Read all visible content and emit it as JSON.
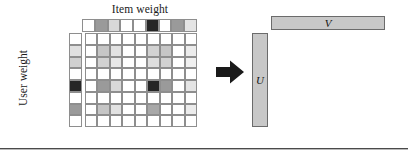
{
  "figure": {
    "labels": {
      "item_weight": "Item weight",
      "user_weight": "User weight",
      "u_vector": "U",
      "v_vector": "V"
    },
    "colors": {
      "cell_border": "#8e8e8e",
      "bar_fill": "#c8c8c8",
      "bar_border": "#6b6b6b",
      "arrow_fill": "#1a1a1a",
      "rule": "#4a4a4a",
      "white": "#ffffff",
      "light_gray": "#dcdcdc",
      "mid_gray": "#b4b4b4",
      "dark_gray": "#8c8c8c",
      "black": "#262626"
    },
    "item_weight_row": {
      "count": 9,
      "shades": [
        "#ffffff",
        "#9a9a9a",
        "#d8d8d8",
        "#ffffff",
        "#ffffff",
        "#262626",
        "#ffffff",
        "#9a9a9a",
        "#e4e4e4"
      ]
    },
    "user_weight_column": {
      "count": 8,
      "shades": [
        "#ffffff",
        "#e0e0e0",
        "#d0d0d0",
        "#ffffff",
        "#262626",
        "#ffffff",
        "#9a9a9a",
        "#ffffff"
      ]
    },
    "matrix": {
      "rows": 8,
      "cols": 9,
      "shades": [
        [
          "#ffffff",
          "#ffffff",
          "#ffffff",
          "#ffffff",
          "#ffffff",
          "#ffffff",
          "#ffffff",
          "#ffffff",
          "#ffffff"
        ],
        [
          "#ffffff",
          "#c6c6c6",
          "#e2e2e2",
          "#ffffff",
          "#ffffff",
          "#d2d2d2",
          "#c6c6c6",
          "#ffffff",
          "#ececec"
        ],
        [
          "#ffffff",
          "#d2d2d2",
          "#e8e8e8",
          "#ffffff",
          "#ffffff",
          "#dedede",
          "#d2d2d2",
          "#ffffff",
          "#f0f0f0"
        ],
        [
          "#ffffff",
          "#ffffff",
          "#ffffff",
          "#ffffff",
          "#ffffff",
          "#ffffff",
          "#ffffff",
          "#ffffff",
          "#ffffff"
        ],
        [
          "#ffffff",
          "#9a9a9a",
          "#d8d8d8",
          "#ffffff",
          "#ffffff",
          "#262626",
          "#9a9a9a",
          "#ffffff",
          "#e4e4e4"
        ],
        [
          "#ffffff",
          "#ffffff",
          "#ffffff",
          "#ffffff",
          "#ffffff",
          "#ffffff",
          "#ffffff",
          "#ffffff",
          "#ffffff"
        ],
        [
          "#ffffff",
          "#c6c6c6",
          "#e2e2e2",
          "#ffffff",
          "#ffffff",
          "#a8a8a8",
          "#ffffff",
          "#ffffff",
          "#ececec"
        ],
        [
          "#ffffff",
          "#ffffff",
          "#ffffff",
          "#ffffff",
          "#ffffff",
          "#ffffff",
          "#ffffff",
          "#ffffff",
          "#ffffff"
        ]
      ]
    }
  }
}
